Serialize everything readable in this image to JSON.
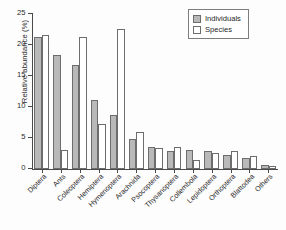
{
  "chart_data": {
    "type": "bar",
    "title": "",
    "xlabel": "",
    "ylabel": "Relative abundance (%)",
    "ylim": [
      0,
      25
    ],
    "yticks": [
      0,
      5,
      10,
      15,
      20,
      25
    ],
    "grid": false,
    "legend_position": "top-right",
    "categories": [
      "Diptera",
      "Ants",
      "Coleoptera",
      "Hemiptera",
      "Hymenoptera",
      "Arachnida",
      "Psocoptera",
      "Thysanoptera",
      "Collembola",
      "Lepidoptera",
      "Orthoptera",
      "Blattodea",
      "Others"
    ],
    "series": [
      {
        "name": "Individuals",
        "color": "#b9b9b9",
        "values": [
          21.3,
          18.3,
          16.8,
          11.1,
          8.7,
          4.8,
          3.5,
          2.9,
          3.0,
          2.9,
          2.3,
          1.8,
          0.6
        ]
      },
      {
        "name": "Species",
        "color": "#ffffff",
        "values": [
          21.6,
          3.0,
          21.3,
          7.3,
          22.6,
          6.0,
          3.3,
          3.6,
          1.5,
          2.5,
          2.8,
          2.0,
          0.4
        ]
      }
    ]
  },
  "legend": {
    "entries": [
      {
        "label": "Individuals",
        "swatch": "filled-gray"
      },
      {
        "label": "Species",
        "swatch": "empty-white"
      }
    ]
  },
  "axis": {
    "y_tick_labels": [
      "0",
      "5",
      "10",
      "15",
      "20",
      "25"
    ]
  }
}
